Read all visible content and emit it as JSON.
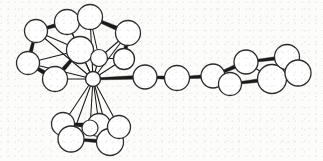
{
  "figure": {
    "kind": "ball-and-stick-molecular-structure",
    "title": "",
    "caption": "",
    "background_color": "#fcfcfb",
    "atom_fill_color": "#ffffff",
    "atom_stroke_color": "#2b2b2b",
    "bond_color": "#1a1a1a",
    "atom_count": 29,
    "labels": []
  },
  "structure": {
    "central_atom": {
      "name": "metal-center",
      "cx": 93,
      "cy": 79,
      "r": 7.5,
      "stroke_width": 1.4
    },
    "cluster_upper": {
      "name": "upper-cage",
      "atoms": [
        {
          "cx": 36,
          "cy": 31,
          "r": 11.5,
          "sw": 1.3
        },
        {
          "cx": 67,
          "cy": 22,
          "r": 12.5,
          "sw": 1.3
        },
        {
          "cx": 28,
          "cy": 63,
          "r": 11.5,
          "sw": 1.3
        },
        {
          "cx": 55,
          "cy": 79,
          "r": 12.5,
          "sw": 1.3
        },
        {
          "cx": 80,
          "cy": 50,
          "r": 13.5,
          "sw": 1.3
        },
        {
          "cx": 90,
          "cy": 17,
          "r": 12.5,
          "sw": 1.3
        },
        {
          "cx": 128,
          "cy": 33,
          "r": 12.5,
          "sw": 1.3
        },
        {
          "cx": 124,
          "cy": 59,
          "r": 10.5,
          "sw": 1.3
        },
        {
          "cx": 99,
          "cy": 58,
          "r": 8.5,
          "sw": 1.2
        }
      ]
    },
    "cluster_lower": {
      "name": "lower-cage",
      "atoms": [
        {
          "cx": 63,
          "cy": 124,
          "r": 11.5,
          "sw": 1.3
        },
        {
          "cx": 71,
          "cy": 139,
          "r": 13.0,
          "sw": 1.3
        },
        {
          "cx": 99,
          "cy": 125,
          "r": 11.5,
          "sw": 1.3
        },
        {
          "cx": 110,
          "cy": 142,
          "r": 13.5,
          "sw": 1.3
        },
        {
          "cx": 119,
          "cy": 127,
          "r": 11.5,
          "sw": 1.3
        },
        {
          "cx": 90,
          "cy": 128,
          "r": 8.0,
          "sw": 1.2
        }
      ]
    },
    "chain": {
      "name": "linker-chain",
      "atoms": [
        {
          "cx": 145,
          "cy": 77,
          "r": 12.0,
          "sw": 1.3
        },
        {
          "cx": 177,
          "cy": 78,
          "r": 12.5,
          "sw": 1.3
        }
      ]
    },
    "aryl_ring": {
      "name": "aromatic-ring",
      "atoms": [
        {
          "cx": 213,
          "cy": 76,
          "r": 12.0,
          "sw": 1.3
        },
        {
          "cx": 230,
          "cy": 84,
          "r": 11.5,
          "sw": 1.3
        },
        {
          "cx": 246,
          "cy": 62,
          "r": 12.0,
          "sw": 1.3
        },
        {
          "cx": 272,
          "cy": 79,
          "r": 14.5,
          "sw": 1.3
        },
        {
          "cx": 287,
          "cy": 57,
          "r": 12.5,
          "sw": 1.3
        },
        {
          "cx": 298,
          "cy": 73,
          "r": 13.0,
          "sw": 1.3
        }
      ]
    },
    "thick_bonds": [
      {
        "x1": 36,
        "y1": 31,
        "x2": 67,
        "y2": 22,
        "w": 3.6
      },
      {
        "x1": 67,
        "y1": 22,
        "x2": 90,
        "y2": 17,
        "w": 3.2
      },
      {
        "x1": 90,
        "y1": 17,
        "x2": 128,
        "y2": 33,
        "w": 4.0
      },
      {
        "x1": 128,
        "y1": 33,
        "x2": 124,
        "y2": 59,
        "w": 3.6
      },
      {
        "x1": 36,
        "y1": 31,
        "x2": 28,
        "y2": 63,
        "w": 3.4
      },
      {
        "x1": 28,
        "y1": 63,
        "x2": 55,
        "y2": 79,
        "w": 4.0
      },
      {
        "x1": 80,
        "y1": 50,
        "x2": 55,
        "y2": 79,
        "w": 3.8
      },
      {
        "x1": 93,
        "y1": 79,
        "x2": 145,
        "y2": 77,
        "w": 3.2
      },
      {
        "x1": 145,
        "y1": 77,
        "x2": 177,
        "y2": 78,
        "w": 3.2
      },
      {
        "x1": 177,
        "y1": 78,
        "x2": 213,
        "y2": 76,
        "w": 3.2
      },
      {
        "x1": 213,
        "y1": 76,
        "x2": 246,
        "y2": 62,
        "w": 3.6
      },
      {
        "x1": 246,
        "y1": 62,
        "x2": 287,
        "y2": 57,
        "w": 3.2
      },
      {
        "x1": 230,
        "y1": 84,
        "x2": 272,
        "y2": 79,
        "w": 3.4
      },
      {
        "x1": 272,
        "y1": 79,
        "x2": 298,
        "y2": 73,
        "w": 3.4
      },
      {
        "x1": 63,
        "y1": 124,
        "x2": 99,
        "y2": 125,
        "w": 3.4
      },
      {
        "x1": 71,
        "y1": 139,
        "x2": 110,
        "y2": 142,
        "w": 3.4
      },
      {
        "x1": 99,
        "y1": 125,
        "x2": 119,
        "y2": 127,
        "w": 3.0
      }
    ],
    "thin_bonds": [
      {
        "x1": 93,
        "y1": 79,
        "x2": 36,
        "y2": 31
      },
      {
        "x1": 93,
        "y1": 79,
        "x2": 67,
        "y2": 22
      },
      {
        "x1": 93,
        "y1": 79,
        "x2": 28,
        "y2": 63
      },
      {
        "x1": 93,
        "y1": 79,
        "x2": 55,
        "y2": 79
      },
      {
        "x1": 93,
        "y1": 79,
        "x2": 80,
        "y2": 50
      },
      {
        "x1": 93,
        "y1": 79,
        "x2": 90,
        "y2": 17
      },
      {
        "x1": 93,
        "y1": 79,
        "x2": 128,
        "y2": 33
      },
      {
        "x1": 93,
        "y1": 79,
        "x2": 124,
        "y2": 59
      },
      {
        "x1": 93,
        "y1": 79,
        "x2": 99,
        "y2": 58
      },
      {
        "x1": 93,
        "y1": 79,
        "x2": 63,
        "y2": 124
      },
      {
        "x1": 93,
        "y1": 79,
        "x2": 71,
        "y2": 139
      },
      {
        "x1": 93,
        "y1": 79,
        "x2": 99,
        "y2": 125
      },
      {
        "x1": 93,
        "y1": 79,
        "x2": 110,
        "y2": 142
      },
      {
        "x1": 93,
        "y1": 79,
        "x2": 119,
        "y2": 127
      },
      {
        "x1": 93,
        "y1": 79,
        "x2": 90,
        "y2": 128
      },
      {
        "x1": 36,
        "y1": 31,
        "x2": 80,
        "y2": 50
      },
      {
        "x1": 28,
        "y1": 63,
        "x2": 80,
        "y2": 50
      },
      {
        "x1": 67,
        "y1": 22,
        "x2": 80,
        "y2": 50
      },
      {
        "x1": 90,
        "y1": 17,
        "x2": 99,
        "y2": 58
      },
      {
        "x1": 128,
        "y1": 33,
        "x2": 99,
        "y2": 58
      },
      {
        "x1": 124,
        "y1": 59,
        "x2": 99,
        "y2": 58
      },
      {
        "x1": 99,
        "y1": 58,
        "x2": 80,
        "y2": 50
      },
      {
        "x1": 63,
        "y1": 124,
        "x2": 71,
        "y2": 139
      },
      {
        "x1": 99,
        "y1": 125,
        "x2": 110,
        "y2": 142
      },
      {
        "x1": 119,
        "y1": 127,
        "x2": 110,
        "y2": 142
      },
      {
        "x1": 63,
        "y1": 124,
        "x2": 90,
        "y2": 128
      },
      {
        "x1": 90,
        "y1": 128,
        "x2": 119,
        "y2": 127
      },
      {
        "x1": 213,
        "y1": 76,
        "x2": 230,
        "y2": 84
      },
      {
        "x1": 246,
        "y1": 62,
        "x2": 272,
        "y2": 79
      },
      {
        "x1": 287,
        "y1": 57,
        "x2": 298,
        "y2": 73
      }
    ]
  }
}
